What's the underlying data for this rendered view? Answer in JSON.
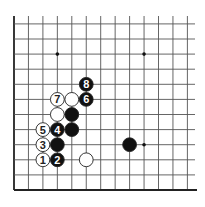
{
  "diagram": {
    "type": "go-board",
    "visible_region": "lower-left corner",
    "visible_columns": 13,
    "visible_rows": 12,
    "edges": [
      "left",
      "bottom"
    ],
    "colors": {
      "background": "#ffffff",
      "line": "#555555",
      "edge": "#222222",
      "black_stone": "#111111",
      "white_stone": "#ffffff",
      "star_point": "#111111"
    },
    "star_points": [
      {
        "col": 3,
        "row": 9
      },
      {
        "col": 9,
        "row": 9
      },
      {
        "col": 9,
        "row": 3
      }
    ],
    "stones": [
      {
        "color": "white",
        "col": 2,
        "row": 2,
        "label": "1"
      },
      {
        "color": "black",
        "col": 3,
        "row": 2,
        "label": "2"
      },
      {
        "color": "white",
        "col": 2,
        "row": 3,
        "label": "3"
      },
      {
        "color": "black",
        "col": 3,
        "row": 4,
        "label": "4"
      },
      {
        "color": "white",
        "col": 2,
        "row": 4,
        "label": "5"
      },
      {
        "color": "black",
        "col": 5,
        "row": 6,
        "label": "6"
      },
      {
        "color": "white",
        "col": 3,
        "row": 6,
        "label": "7"
      },
      {
        "color": "black",
        "col": 5,
        "row": 7,
        "label": "8"
      },
      {
        "color": "white",
        "col": 4,
        "row": 6,
        "label": ""
      },
      {
        "color": "white",
        "col": 3,
        "row": 5,
        "label": ""
      },
      {
        "color": "black",
        "col": 4,
        "row": 5,
        "label": ""
      },
      {
        "color": "black",
        "col": 4,
        "row": 4,
        "label": ""
      },
      {
        "color": "black",
        "col": 3,
        "row": 3,
        "label": ""
      },
      {
        "color": "white",
        "col": 5,
        "row": 2,
        "label": ""
      },
      {
        "color": "black",
        "col": 8,
        "row": 3,
        "label": ""
      }
    ]
  }
}
